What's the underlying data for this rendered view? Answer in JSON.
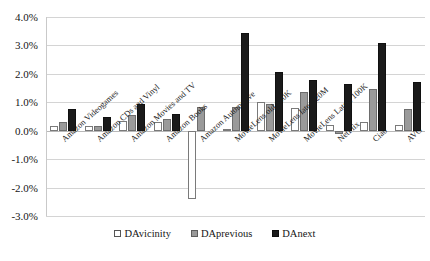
{
  "chart_data": {
    "type": "bar",
    "title": "",
    "xlabel": "",
    "ylabel": "",
    "ylim": [
      -3.0,
      4.0
    ],
    "ytick_labels": [
      "4.0%",
      "3.0%",
      "2.0%",
      "1.0%",
      "0.0%",
      "-1.0%",
      "-2.0%",
      "-3.0%"
    ],
    "ytick_values": [
      4.0,
      3.0,
      2.0,
      1.0,
      0.0,
      -1.0,
      -2.0,
      -3.0
    ],
    "grid": true,
    "legend_position": "bottom",
    "categories": [
      "Amazon Videogames",
      "Amazon CDs and Vinyl",
      "Amazon Movies and TV",
      "Amazon Books",
      "Amazon Automotive",
      "MovieLens old 100K",
      "MovieLens latest 20M",
      "MovieLens Latest 100K",
      "NetFlix",
      "Ciao",
      "AVG"
    ],
    "series": [
      {
        "name": "DAvicinity",
        "color": "#ffffff",
        "values": [
          0.15,
          0.15,
          0.35,
          0.3,
          -2.4,
          0.05,
          1.0,
          0.8,
          0.2,
          0.3,
          0.2
        ]
      },
      {
        "name": "DAprevious",
        "color": "#9a9a9a",
        "values": [
          0.3,
          0.15,
          0.55,
          0.4,
          0.85,
          0.85,
          0.95,
          1.35,
          -0.1,
          1.45,
          0.75
        ]
      },
      {
        "name": "DAnext",
        "color": "#1a1a1a",
        "values": [
          0.75,
          0.5,
          0.95,
          0.6,
          0.0,
          3.45,
          2.05,
          1.8,
          1.65,
          3.1,
          1.7
        ]
      }
    ]
  },
  "legend": {
    "items": [
      {
        "label": "DAvicinity",
        "swatch": "vicinity"
      },
      {
        "label": "DAprevious",
        "swatch": "previous"
      },
      {
        "label": "DAnext",
        "swatch": "next"
      }
    ]
  }
}
